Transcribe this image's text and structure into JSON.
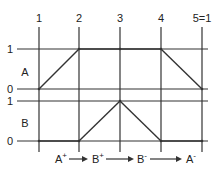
{
  "diagram": {
    "step_labels": [
      "1",
      "2",
      "3",
      "4",
      "5=1"
    ],
    "actuators": [
      {
        "name": "A",
        "high_label": "1",
        "low_label": "0",
        "states": [
          0,
          1,
          1,
          1,
          0
        ]
      },
      {
        "name": "B",
        "high_label": "1",
        "low_label": "0",
        "states": [
          0,
          0,
          1,
          0,
          0
        ]
      }
    ],
    "sequence": [
      {
        "base": "A",
        "sign": "+"
      },
      {
        "base": "B",
        "sign": "+"
      },
      {
        "base": "B",
        "sign": "-"
      },
      {
        "base": "A",
        "sign": "-"
      }
    ],
    "colors": {
      "line": "#333333",
      "text": "#222222"
    }
  }
}
